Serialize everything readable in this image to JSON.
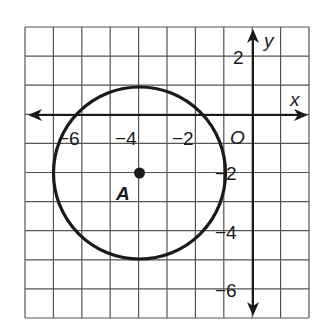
{
  "diagram": {
    "type": "coordinate-plane-circle",
    "grid": {
      "x_min": -8,
      "x_max": 2,
      "y_min": -7,
      "y_max": 3,
      "step": 1
    },
    "axes": {
      "x_label": "x",
      "y_label": "y",
      "origin_label": "O"
    },
    "x_ticks": [
      {
        "value": -6,
        "label": "−6"
      },
      {
        "value": -4,
        "label": "−4"
      },
      {
        "value": -2,
        "label": "−2"
      }
    ],
    "y_ticks": [
      {
        "value": 2,
        "label": "2"
      },
      {
        "value": -2,
        "label": "−2"
      },
      {
        "value": -4,
        "label": "−4"
      },
      {
        "value": -6,
        "label": "−6"
      }
    ],
    "circle": {
      "center": [
        -4,
        -2
      ],
      "radius": 3
    },
    "point": {
      "label": "A",
      "coords": [
        -4,
        -2
      ]
    },
    "colors": {
      "grid": "#555555",
      "stroke": "#1a1a1a",
      "background": "#ffffff"
    }
  }
}
